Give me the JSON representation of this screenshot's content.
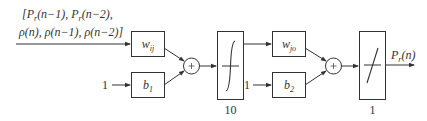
{
  "diagram": {
    "type": "neural-network-block-diagram",
    "input": {
      "line1": "[P",
      "line1_sub": "r",
      "line1_a": "(n−1), P",
      "line1_sub2": "r",
      "line1_b": "(n−2),",
      "line2": "ρ(n), ρ(n−1), ρ(n−2)]"
    },
    "bias_inputs": [
      "1",
      "1"
    ],
    "blocks": [
      {
        "id": "w_ij",
        "symbol": "w",
        "sub": "ij"
      },
      {
        "id": "b1",
        "symbol": "b",
        "sub": "1"
      },
      {
        "id": "sum1",
        "symbol": "+"
      },
      {
        "id": "tansig",
        "transfer": "tansig",
        "neurons_label": "10"
      },
      {
        "id": "w_jo",
        "symbol": "w",
        "sub": "jo"
      },
      {
        "id": "b2",
        "symbol": "b",
        "sub": "2"
      },
      {
        "id": "sum2",
        "symbol": "+"
      },
      {
        "id": "purelin",
        "transfer": "purelin",
        "neurons_label": "1"
      }
    ],
    "output": {
      "symbol": "P",
      "sub": "r",
      "arg": "(n)"
    },
    "colors": {
      "stroke": "#333333",
      "background": "#ffffff"
    }
  }
}
